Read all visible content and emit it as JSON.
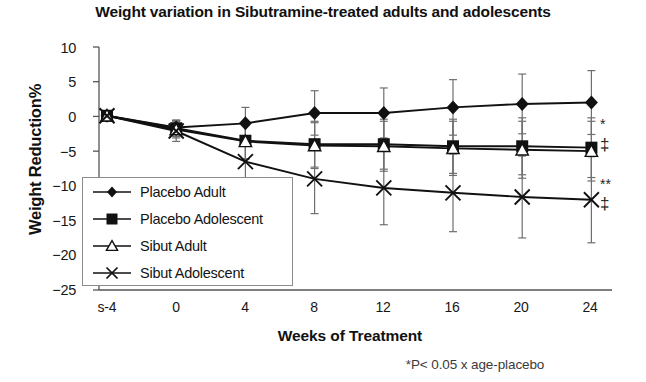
{
  "chart_data": {
    "type": "line",
    "title": "Weight variation in Sibutramine-treated adults and adolescents",
    "xlabel": "Weeks of Treatment",
    "ylabel": "Weight Reduction%",
    "footnote": "*P< 0.05 x age-placebo",
    "categories": [
      "s-4",
      "0",
      "4",
      "8",
      "12",
      "16",
      "20",
      "24"
    ],
    "x": [
      -4,
      0,
      4,
      8,
      12,
      16,
      20,
      24
    ],
    "ylim": [
      -25,
      10
    ],
    "yticks": [
      10,
      5,
      0,
      -5,
      -10,
      -15,
      -20,
      -25
    ],
    "grid": false,
    "legend_position": "lower-left-inside",
    "series": [
      {
        "name": "Placebo Adult",
        "marker": "diamond",
        "values": [
          0.1,
          -1.6,
          -1.0,
          0.5,
          0.5,
          1.3,
          1.8,
          2.0
        ],
        "err_low": [
          0.1,
          1.0,
          2.3,
          3.2,
          3.6,
          4.0,
          4.3,
          4.6
        ],
        "err_high": [
          0.1,
          1.0,
          2.3,
          3.2,
          3.6,
          4.0,
          4.3,
          4.6
        ]
      },
      {
        "name": "Placebo Adolescent",
        "marker": "square",
        "values": [
          0.1,
          -1.7,
          -3.5,
          -4.0,
          -4.0,
          -4.3,
          -4.3,
          -4.5
        ],
        "err_low": [
          0.1,
          1.2,
          2.6,
          3.3,
          3.6,
          3.9,
          4.1,
          4.3
        ],
        "err_high": [
          0.1,
          1.2,
          2.6,
          3.3,
          3.6,
          3.9,
          4.1,
          4.3
        ]
      },
      {
        "name": "Sibut Adult",
        "marker": "triangle-open",
        "values": [
          0.1,
          -1.9,
          -3.6,
          -4.2,
          -4.3,
          -4.6,
          -4.8,
          -5.0
        ],
        "err_low": [
          0.1,
          1.2,
          2.6,
          3.3,
          3.6,
          3.9,
          4.1,
          4.3
        ],
        "err_high": [
          0.1,
          1.2,
          2.6,
          3.3,
          3.6,
          3.9,
          4.1,
          4.3
        ]
      },
      {
        "name": "Sibut Adolescent",
        "marker": "cross-x",
        "values": [
          0.1,
          -2.1,
          -6.5,
          -9.0,
          -10.3,
          -11.0,
          -11.6,
          -12.0
        ],
        "err_low": [
          0.1,
          1.5,
          3.5,
          5.0,
          5.3,
          5.6,
          5.9,
          6.2
        ],
        "err_high": [
          0.1,
          1.5,
          3.5,
          5.0,
          5.3,
          5.6,
          5.9,
          6.2
        ]
      }
    ],
    "annotations": [
      {
        "text": "*",
        "series": "Placebo Adolescent",
        "at_x": 24
      },
      {
        "text": "‡",
        "series": "Placebo Adolescent",
        "at_x": 24
      },
      {
        "text": "**",
        "series": "Sibut Adolescent",
        "at_x": 24
      },
      {
        "text": "‡",
        "series": "Sibut Adolescent",
        "at_x": 24
      }
    ]
  },
  "labels": {
    "y": [
      "10",
      "5",
      "0",
      "−5",
      "−10",
      "−15",
      "−20",
      "−25"
    ],
    "x": [
      "s-4",
      "0",
      "4",
      "8",
      "12",
      "16",
      "20",
      "24"
    ]
  },
  "legend": {
    "items": [
      {
        "label": "Placebo Adult"
      },
      {
        "label": "Placebo Adolescent"
      },
      {
        "label": "Sibut Adult"
      },
      {
        "label": "Sibut Adolescent"
      }
    ]
  },
  "sig": {
    "star": "*",
    "dagger": "‡",
    "double_star": "**",
    "dagger2": "‡"
  },
  "colors": {
    "line": "#111111",
    "axis": "#555555",
    "text": "#171717",
    "legend_border": "#8c8c8c"
  }
}
